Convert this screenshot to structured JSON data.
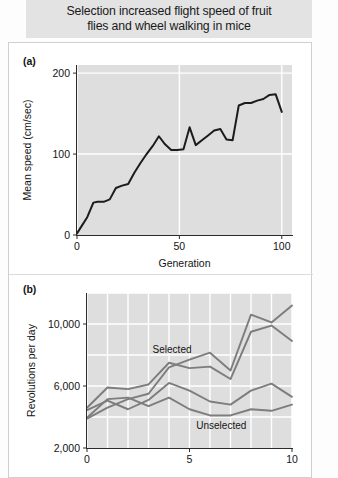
{
  "figure": {
    "title": "Selection increased flight speed of fruit flies and wheel walking in mice",
    "title_line1": "Selection increased flight speed of fruit",
    "title_line2": "flies and wheel walking in mice",
    "title_bg": "#e3e3e3",
    "card_bg": "#ffffff"
  },
  "panels": [
    {
      "id": "a",
      "label": "(a)"
    },
    {
      "id": "b",
      "label": "(b)"
    }
  ],
  "chart_data": [
    {
      "id": "panel-a",
      "type": "line",
      "title": "",
      "xlabel": "Generation",
      "ylabel": "Mean speed (cm/sec)",
      "xlim": [
        0,
        105
      ],
      "ylim": [
        0,
        210
      ],
      "xticks": [
        0,
        50,
        100
      ],
      "xtick_labels": [
        "0",
        "50",
        "100"
      ],
      "yticks": [
        0,
        100,
        200
      ],
      "ytick_labels": [
        "0",
        "100",
        "200"
      ],
      "grid": true,
      "grid_color": "#ffffff",
      "plot_bg": "#dedede",
      "legend": "none",
      "series": [
        {
          "name": "Mean flight speed",
          "color": "#1c1c1c",
          "width": 2.0,
          "x": [
            0,
            2,
            5,
            8,
            10,
            13,
            16,
            19,
            22,
            25,
            28,
            31,
            34,
            37,
            40,
            43,
            46,
            49,
            52,
            55,
            58,
            61,
            64,
            67,
            70,
            73,
            76,
            79,
            82,
            85,
            88,
            91,
            94,
            97,
            100
          ],
          "y": [
            2,
            10,
            22,
            40,
            41,
            41,
            44,
            58,
            61,
            63,
            77,
            89,
            100,
            110,
            122,
            112,
            105,
            105,
            106,
            133,
            111,
            117,
            123,
            129,
            131,
            118,
            117,
            160,
            163,
            163,
            166,
            168,
            173,
            174,
            152
          ]
        }
      ]
    },
    {
      "id": "panel-b",
      "type": "line",
      "title": "",
      "xlabel": "",
      "ylabel": "Revolutions per day",
      "xlim": [
        0,
        10
      ],
      "ylim": [
        2000,
        12000
      ],
      "xticks": [
        0,
        1,
        2,
        3,
        4,
        5,
        6,
        7,
        8,
        9,
        10
      ],
      "xtick_labels": [
        "0",
        "",
        "",
        "",
        "",
        "5",
        "",
        "",
        "",
        "",
        "10"
      ],
      "yticks": [
        2000,
        4000,
        6000,
        8000,
        10000,
        12000
      ],
      "ytick_labels": [
        "2,000",
        "",
        "6,000",
        "",
        "10,000",
        ""
      ],
      "ytick_label_shown": [
        2000,
        6000,
        10000
      ],
      "grid": true,
      "grid_color": "#ffffff",
      "plot_bg": "#dedede",
      "legend": "inline-annotations",
      "annotations": [
        {
          "text": "Selected",
          "x": 4.15,
          "y": 8150,
          "color": "#9d9d9d"
        },
        {
          "text": "Unselected",
          "x": 6.55,
          "y": 3250,
          "color": "#9d9d9d"
        }
      ],
      "series": [
        {
          "name": "Selected line 1",
          "group": "Selected",
          "color": "#7d7d7d",
          "width": 1.9,
          "x": [
            0,
            1,
            2,
            3,
            4,
            5,
            6,
            7,
            8,
            9,
            10
          ],
          "y": [
            3900,
            4600,
            5150,
            5500,
            7200,
            7700,
            8150,
            7000,
            10600,
            10100,
            11200
          ]
        },
        {
          "name": "Selected line 2",
          "group": "Selected",
          "color": "#7d7d7d",
          "width": 1.9,
          "x": [
            0,
            1,
            2,
            3,
            4,
            5,
            6,
            7,
            8,
            9,
            10
          ],
          "y": [
            4600,
            5900,
            5800,
            6100,
            7500,
            7150,
            7250,
            6450,
            9500,
            9900,
            8900
          ]
        },
        {
          "name": "Unselected line 1",
          "group": "Unselected",
          "color": "#7d7d7d",
          "width": 1.9,
          "x": [
            0,
            1,
            2,
            3,
            4,
            5,
            6,
            7,
            8,
            9,
            10
          ],
          "y": [
            4450,
            5050,
            4500,
            5100,
            6200,
            5700,
            5000,
            4800,
            5700,
            6150,
            5300
          ]
        },
        {
          "name": "Unselected line 2",
          "group": "Unselected",
          "color": "#7d7d7d",
          "width": 1.9,
          "x": [
            0,
            1,
            2,
            3,
            4,
            5,
            6,
            7,
            8,
            9,
            10
          ],
          "y": [
            3950,
            5150,
            5250,
            4700,
            5250,
            4500,
            4100,
            4100,
            4500,
            4400,
            4800
          ]
        }
      ]
    }
  ]
}
